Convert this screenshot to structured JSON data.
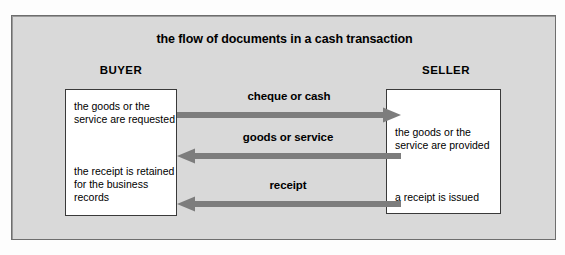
{
  "diagram": {
    "title": "the flow of documents in a cash transaction",
    "background_color": "#d9d9d9",
    "border_color": "#6e6e6e",
    "box_fill_color": "#ffffff",
    "box_border_color": "#3a3a3a",
    "arrow_color": "#7d7d7d"
  },
  "parties": {
    "buyer": {
      "label": "BUYER",
      "paragraphs": [
        "the goods or the service are requested",
        "the receipt is retained for the business records"
      ]
    },
    "seller": {
      "label": "SELLER",
      "paragraphs": [
        "the goods or the service are provided",
        "a receipt is issued"
      ]
    }
  },
  "flows": [
    {
      "label": "cheque or cash",
      "from": "BUYER",
      "to": "SELLER",
      "direction": "right"
    },
    {
      "label": "goods or service",
      "from": "SELLER",
      "to": "BUYER",
      "direction": "left"
    },
    {
      "label": "receipt",
      "from": "SELLER",
      "to": "BUYER",
      "direction": "left"
    }
  ]
}
